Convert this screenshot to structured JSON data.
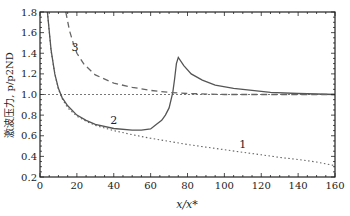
{
  "chart_data": {
    "type": "line",
    "title": "",
    "xlabel": "x/x*",
    "ylabel": "激波压力, p/p2ND",
    "xlim": [
      0,
      160
    ],
    "ylim": [
      0.2,
      1.8
    ],
    "xticks": [
      0,
      20,
      40,
      60,
      80,
      100,
      120,
      140,
      160
    ],
    "yticks": [
      0.2,
      0.4,
      0.6,
      0.8,
      1.0,
      1.2,
      1.4,
      1.6,
      1.8
    ],
    "xtick_labels": [
      "0",
      "20",
      "40",
      "60",
      "80",
      "100",
      "120",
      "140",
      "160"
    ],
    "ytick_labels": [
      "0.2",
      "0.4",
      "0.6",
      "0.8",
      "1.0",
      "1.2",
      "1.4",
      "1.6",
      "1.8"
    ],
    "grid": false,
    "reference_line": {
      "y": 1.0,
      "style": "dotted"
    },
    "series": [
      {
        "name": "1",
        "style": "dotted",
        "x": [
          4,
          6,
          8,
          10,
          12,
          15,
          20,
          25,
          30,
          40,
          50,
          60,
          70,
          80,
          90,
          100,
          110,
          120,
          130,
          140,
          150,
          160
        ],
        "y": [
          1.8,
          1.42,
          1.2,
          1.05,
          0.96,
          0.87,
          0.79,
          0.74,
          0.7,
          0.65,
          0.61,
          0.575,
          0.545,
          0.515,
          0.49,
          0.465,
          0.44,
          0.415,
          0.39,
          0.37,
          0.345,
          0.31
        ]
      },
      {
        "name": "2",
        "style": "solid",
        "x": [
          4,
          6,
          8,
          10,
          12,
          15,
          20,
          25,
          30,
          40,
          50,
          55,
          60,
          63,
          66,
          68,
          70,
          72,
          73,
          74,
          75,
          78,
          82,
          88,
          95,
          105,
          115,
          125,
          140,
          160
        ],
        "y": [
          1.8,
          1.43,
          1.2,
          1.06,
          0.97,
          0.89,
          0.8,
          0.75,
          0.71,
          0.67,
          0.655,
          0.655,
          0.665,
          0.71,
          0.75,
          0.8,
          0.87,
          1.02,
          1.15,
          1.3,
          1.36,
          1.28,
          1.2,
          1.14,
          1.09,
          1.06,
          1.04,
          1.02,
          1.01,
          1.0
        ]
      },
      {
        "name": "3",
        "style": "dashed",
        "x": [
          14,
          16,
          18,
          20,
          24,
          30,
          40,
          50,
          60,
          70,
          80,
          100,
          120,
          140,
          160
        ],
        "y": [
          1.8,
          1.62,
          1.5,
          1.4,
          1.29,
          1.19,
          1.11,
          1.07,
          1.04,
          1.02,
          1.01,
          1.0,
          1.0,
          1.0,
          1.0
        ]
      }
    ],
    "annotations": [
      {
        "text": "1",
        "x": 110,
        "y": 0.48
      },
      {
        "text": "2",
        "x": 40,
        "y": 0.71
      },
      {
        "text": "3",
        "x": 19,
        "y": 1.42
      }
    ]
  }
}
